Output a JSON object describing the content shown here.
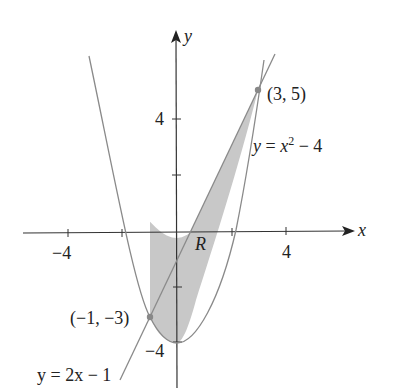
{
  "diagram": {
    "axes": {
      "x_label": "x",
      "y_label": "y",
      "x_ticks": [
        {
          "value": -4,
          "label": "−4"
        },
        {
          "value": -2,
          "label": ""
        },
        {
          "value": 2,
          "label": ""
        },
        {
          "value": 4,
          "label": "4"
        }
      ],
      "y_ticks": [
        {
          "value": 4,
          "label": "4"
        },
        {
          "value": 2,
          "label": ""
        },
        {
          "value": -2,
          "label": ""
        },
        {
          "value": -4,
          "label": "−4"
        }
      ]
    },
    "curves": [
      {
        "name": "parabola",
        "equation_prefix": "y = x",
        "equation_exp": "2",
        "equation_suffix": " − 4"
      },
      {
        "name": "line",
        "equation": "y = 2x − 1"
      }
    ],
    "points": [
      {
        "label": "(3, 5)",
        "x": 3,
        "y": 5
      },
      {
        "label": "(−1, −3)",
        "x": -1,
        "y": -3
      }
    ],
    "region_label": "R",
    "colors": {
      "fill": "#c8c8c8",
      "curve": "#8a8a8a",
      "axis": "#333333",
      "point": "#888888"
    }
  }
}
